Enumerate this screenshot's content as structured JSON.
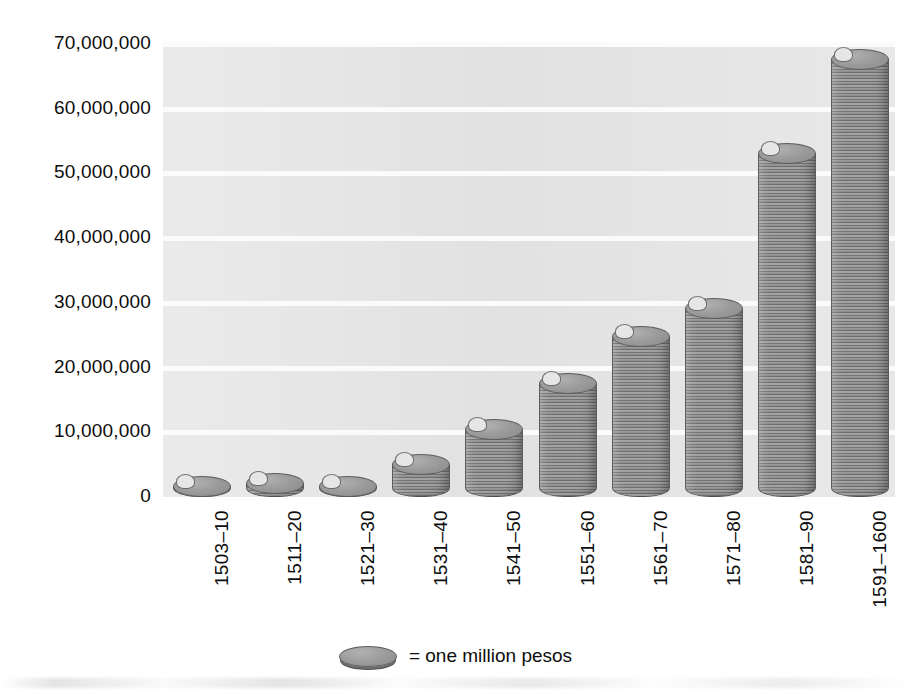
{
  "chart_data": {
    "type": "bar",
    "title": "",
    "subtitle": "",
    "xlabel": "",
    "ylabel": "",
    "ylim": [
      0,
      70000000
    ],
    "grid": true,
    "legend_position": "bottom-center",
    "categories": [
      "1503–10",
      "1511–20",
      "1521–30",
      "1531–40",
      "1541–50",
      "1551–60",
      "1561–70",
      "1571–80",
      "1581–90",
      "1591–1600"
    ],
    "values": [
      1500000,
      2000000,
      1400000,
      5000000,
      10400000,
      17400000,
      24700000,
      29000000,
      53000000,
      67600000
    ],
    "ytick_labels": [
      "0",
      "10,000,000",
      "20,000,000",
      "30,000,000",
      "40,000,000",
      "50,000,000",
      "60,000,000",
      "70,000,000"
    ],
    "ytick_values": [
      0,
      10000000,
      20000000,
      30000000,
      40000000,
      50000000,
      60000000,
      70000000
    ],
    "legend": [
      {
        "symbol": "coin-icon",
        "label": "= one million pesos"
      }
    ],
    "unit_note": "= one million pesos",
    "colors": {
      "plot_background": "#e6e6e6",
      "gridline": "#fbfbfb",
      "bar_fill": "#8f8f8f",
      "bar_edge": "#5d5d5d",
      "coin_top": "#9b9b9b",
      "text": "#0d0d0d",
      "page_background": "#ffffff"
    }
  }
}
